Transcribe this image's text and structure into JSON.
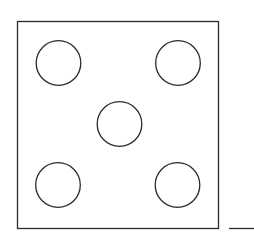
{
  "diagram": {
    "title": "",
    "background": "#ffffff",
    "stroke_color": "#2b2b2b",
    "die_face": {
      "value": 5,
      "square": {
        "x": 17.5,
        "y": 21.5,
        "width": 201,
        "height": 207,
        "stroke_width": 1.3
      },
      "pips": [
        {
          "id": "top-left",
          "cx": 58.5,
          "cy": 63,
          "r": 22.3
        },
        {
          "id": "top-right",
          "cx": 178,
          "cy": 63,
          "r": 22.3
        },
        {
          "id": "center",
          "cx": 119.5,
          "cy": 124,
          "r": 22.3
        },
        {
          "id": "bottom-left",
          "cx": 58,
          "cy": 185,
          "r": 22.3
        },
        {
          "id": "bottom-right",
          "cx": 177.5,
          "cy": 185,
          "r": 22.3
        }
      ],
      "pip_stroke_width": 1.3
    },
    "baseline_segment": {
      "x1": 229,
      "y1": 228.5,
      "x2": 254,
      "y2": 228.5,
      "stroke_width": 1.3
    }
  }
}
